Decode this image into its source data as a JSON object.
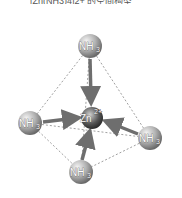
{
  "caption": "[Zn(NH3)4]2+ 的空间构型",
  "diagram": {
    "center": {
      "label": "Zn",
      "charge": "2+",
      "x": 92,
      "y": 118
    },
    "ligands": [
      {
        "label": "NH",
        "sub": "3",
        "x": 90,
        "y": 46
      },
      {
        "label": "NH",
        "sub": "3",
        "x": 30,
        "y": 123
      },
      {
        "label": "NH",
        "sub": "3",
        "x": 150,
        "y": 138
      },
      {
        "label": "NH",
        "sub": "3",
        "x": 81,
        "y": 172
      }
    ],
    "colors": {
      "sphere": "#9a9a9a",
      "arrow": "#6e6e6e",
      "edge": "#888888"
    }
  }
}
